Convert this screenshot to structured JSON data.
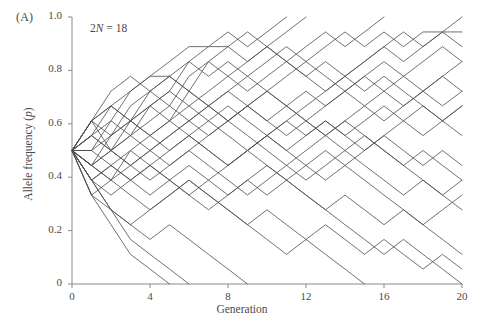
{
  "panel": {
    "label": "(A)"
  },
  "annotation": {
    "prefix": "2",
    "symbol": "N",
    "suffix": " = 18",
    "full": "2N = 18"
  },
  "axes": {
    "xlabel": "Generation",
    "ylabel_prefix": "Allele frequency (",
    "ylabel_symbol": "p",
    "ylabel_suffix": ")",
    "ylabel_full": "Allele frequency (p)",
    "x_ticks": [
      "0",
      "4",
      "8",
      "12",
      "16",
      "20"
    ],
    "y_ticks": [
      "0",
      "0.2",
      "0.4",
      "0.6",
      "0.8",
      "1.0"
    ]
  },
  "style": {
    "line_color": "#4d4d4d",
    "axis_color": "#8a8a8a",
    "text_color": "#4a4a4a",
    "background": "#ffffff",
    "line_width": 0.8
  },
  "chart_data": {
    "type": "line",
    "title": "",
    "subtitle": "",
    "xlabel": "Generation",
    "ylabel": "Allele frequency (p)",
    "annotations": [
      "(A)",
      "2N = 18"
    ],
    "xlim": [
      0,
      20
    ],
    "ylim": [
      0,
      1.0
    ],
    "xticks": [
      0,
      4,
      8,
      12,
      16,
      20
    ],
    "yticks": [
      0,
      0.2,
      0.4,
      0.6,
      0.8,
      1.0
    ],
    "grid": false,
    "legend": "none",
    "population_size_2N": 18,
    "allele_step": 0.0556,
    "initial_frequency": 0.5,
    "x": [
      0,
      1,
      2,
      3,
      4,
      5,
      6,
      7,
      8,
      9,
      10,
      11,
      12,
      13,
      14,
      15,
      16,
      17,
      18,
      19,
      20
    ],
    "series": [
      {
        "name": "pop-1",
        "values": [
          0.5,
          0.611,
          0.667,
          0.722,
          0.778,
          0.778,
          0.833,
          0.889,
          0.889,
          0.833,
          0.889,
          0.944,
          1.0,
          1.0,
          1.0,
          1.0,
          1.0,
          1.0,
          1.0,
          1.0,
          1.0
        ]
      },
      {
        "name": "pop-2",
        "values": [
          0.5,
          0.556,
          0.611,
          0.722,
          0.778,
          0.833,
          0.889,
          0.889,
          0.944,
          0.889,
          0.944,
          1.0,
          1.0,
          1.0,
          1.0,
          1.0,
          1.0,
          1.0,
          1.0,
          1.0,
          1.0
        ]
      },
      {
        "name": "pop-3",
        "values": [
          0.5,
          0.611,
          0.556,
          0.611,
          0.722,
          0.778,
          0.722,
          0.833,
          0.889,
          0.944,
          0.889,
          0.833,
          0.889,
          0.944,
          0.889,
          0.944,
          1.0,
          1.0,
          1.0,
          1.0,
          1.0
        ]
      },
      {
        "name": "pop-4",
        "values": [
          0.5,
          0.556,
          0.667,
          0.611,
          0.667,
          0.722,
          0.833,
          0.778,
          0.833,
          0.778,
          0.833,
          0.889,
          0.833,
          0.889,
          0.944,
          0.889,
          0.944,
          0.889,
          0.944,
          0.944,
          1.0
        ]
      },
      {
        "name": "pop-5",
        "values": [
          0.5,
          0.444,
          0.556,
          0.667,
          0.722,
          0.667,
          0.778,
          0.833,
          0.778,
          0.722,
          0.778,
          0.833,
          0.778,
          0.833,
          0.778,
          0.833,
          0.889,
          0.833,
          0.889,
          0.944,
          0.889
        ]
      },
      {
        "name": "pop-6",
        "values": [
          0.5,
          0.611,
          0.5,
          0.611,
          0.667,
          0.722,
          0.667,
          0.722,
          0.778,
          0.833,
          0.889,
          0.833,
          0.778,
          0.722,
          0.778,
          0.833,
          0.889,
          0.944,
          0.889,
          0.944,
          0.944
        ]
      },
      {
        "name": "pop-7",
        "values": [
          0.5,
          0.5,
          0.611,
          0.556,
          0.667,
          0.611,
          0.722,
          0.667,
          0.722,
          0.778,
          0.722,
          0.778,
          0.833,
          0.778,
          0.722,
          0.778,
          0.833,
          0.778,
          0.833,
          0.889,
          0.833
        ]
      },
      {
        "name": "pop-8",
        "values": [
          0.5,
          0.556,
          0.5,
          0.556,
          0.611,
          0.667,
          0.611,
          0.667,
          0.722,
          0.667,
          0.611,
          0.667,
          0.722,
          0.667,
          0.722,
          0.778,
          0.722,
          0.778,
          0.722,
          0.778,
          0.833
        ]
      },
      {
        "name": "pop-9",
        "values": [
          0.5,
          0.444,
          0.5,
          0.556,
          0.5,
          0.556,
          0.611,
          0.556,
          0.611,
          0.667,
          0.722,
          0.667,
          0.611,
          0.667,
          0.722,
          0.667,
          0.722,
          0.667,
          0.722,
          0.778,
          0.722
        ]
      },
      {
        "name": "pop-10",
        "values": [
          0.5,
          0.611,
          0.667,
          0.611,
          0.556,
          0.5,
          0.556,
          0.611,
          0.556,
          0.5,
          0.556,
          0.611,
          0.556,
          0.611,
          0.556,
          0.611,
          0.667,
          0.611,
          0.556,
          0.611,
          0.667
        ]
      },
      {
        "name": "pop-11",
        "values": [
          0.5,
          0.5,
          0.444,
          0.5,
          0.556,
          0.611,
          0.556,
          0.5,
          0.444,
          0.5,
          0.556,
          0.5,
          0.556,
          0.611,
          0.556,
          0.5,
          0.556,
          0.611,
          0.667,
          0.611,
          0.556
        ]
      },
      {
        "name": "pop-12",
        "values": [
          0.5,
          0.444,
          0.389,
          0.444,
          0.5,
          0.444,
          0.5,
          0.556,
          0.611,
          0.556,
          0.5,
          0.444,
          0.5,
          0.556,
          0.611,
          0.667,
          0.611,
          0.667,
          0.722,
          0.667,
          0.722
        ]
      },
      {
        "name": "pop-13",
        "values": [
          0.5,
          0.389,
          0.444,
          0.389,
          0.444,
          0.389,
          0.333,
          0.389,
          0.444,
          0.5,
          0.556,
          0.5,
          0.444,
          0.389,
          0.444,
          0.5,
          0.556,
          0.5,
          0.444,
          0.5,
          0.444
        ]
      },
      {
        "name": "pop-14",
        "values": [
          0.5,
          0.444,
          0.5,
          0.444,
          0.389,
          0.444,
          0.5,
          0.444,
          0.389,
          0.333,
          0.389,
          0.444,
          0.389,
          0.444,
          0.5,
          0.444,
          0.389,
          0.333,
          0.389,
          0.333,
          0.389
        ]
      },
      {
        "name": "pop-15",
        "values": [
          0.5,
          0.389,
          0.333,
          0.389,
          0.444,
          0.389,
          0.333,
          0.278,
          0.333,
          0.389,
          0.444,
          0.389,
          0.333,
          0.278,
          0.333,
          0.278,
          0.222,
          0.278,
          0.222,
          0.278,
          0.333
        ]
      },
      {
        "name": "pop-16",
        "values": [
          0.5,
          0.333,
          0.389,
          0.333,
          0.278,
          0.333,
          0.389,
          0.333,
          0.278,
          0.222,
          0.278,
          0.222,
          0.167,
          0.222,
          0.167,
          0.111,
          0.167,
          0.111,
          0.056,
          0.111,
          0.056
        ]
      },
      {
        "name": "pop-17",
        "values": [
          0.5,
          0.389,
          0.278,
          0.222,
          0.278,
          0.333,
          0.389,
          0.333,
          0.278,
          0.222,
          0.167,
          0.111,
          0.167,
          0.111,
          0.056,
          0.0,
          0.0,
          0.0,
          0.0,
          0.0,
          0.0
        ]
      },
      {
        "name": "pop-18",
        "values": [
          0.5,
          0.333,
          0.278,
          0.222,
          0.167,
          0.222,
          0.167,
          0.111,
          0.056,
          0.0,
          0.0,
          0.0,
          0.0,
          0.0,
          0.0,
          0.0,
          0.0,
          0.0,
          0.0,
          0.0,
          0.0
        ]
      },
      {
        "name": "pop-19",
        "values": [
          0.5,
          0.389,
          0.278,
          0.167,
          0.111,
          0.056,
          0.0,
          0.0,
          0.0,
          0.0,
          0.0,
          0.0,
          0.0,
          0.0,
          0.0,
          0.0,
          0.0,
          0.0,
          0.0,
          0.0,
          0.0
        ]
      },
      {
        "name": "pop-20",
        "values": [
          0.5,
          0.333,
          0.222,
          0.111,
          0.056,
          0.0,
          0.0,
          0.0,
          0.0,
          0.0,
          0.0,
          0.0,
          0.0,
          0.0,
          0.0,
          0.0,
          0.0,
          0.0,
          0.0,
          0.0,
          0.0
        ]
      },
      {
        "name": "pop-21",
        "values": [
          0.5,
          0.444,
          0.389,
          0.5,
          0.444,
          0.5,
          0.556,
          0.5,
          0.444,
          0.5,
          0.444,
          0.389,
          0.444,
          0.5,
          0.444,
          0.389,
          0.333,
          0.278,
          0.222,
          0.167,
          0.111
        ]
      },
      {
        "name": "pop-22",
        "values": [
          0.5,
          0.556,
          0.5,
          0.444,
          0.5,
          0.556,
          0.611,
          0.667,
          0.611,
          0.667,
          0.722,
          0.667,
          0.611,
          0.556,
          0.611,
          0.556,
          0.5,
          0.444,
          0.389,
          0.333,
          0.278
        ]
      },
      {
        "name": "pop-23",
        "values": [
          0.5,
          0.5,
          0.556,
          0.611,
          0.556,
          0.611,
          0.667,
          0.611,
          0.667,
          0.611,
          0.556,
          0.611,
          0.667,
          0.722,
          0.778,
          0.722,
          0.778,
          0.722,
          0.667,
          0.611,
          0.667
        ]
      },
      {
        "name": "pop-24",
        "values": [
          0.5,
          0.611,
          0.722,
          0.778,
          0.722,
          0.778,
          0.722,
          0.667,
          0.611,
          0.667,
          0.611,
          0.556,
          0.611,
          0.556,
          0.5,
          0.556,
          0.5,
          0.444,
          0.5,
          0.444,
          0.389
        ]
      },
      {
        "name": "pop-25",
        "values": [
          0.5,
          0.389,
          0.444,
          0.389,
          0.333,
          0.389,
          0.444,
          0.389,
          0.333,
          0.389,
          0.333,
          0.389,
          0.333,
          0.278,
          0.222,
          0.167,
          0.111,
          0.167,
          0.111,
          0.056,
          0.0
        ]
      }
    ]
  }
}
